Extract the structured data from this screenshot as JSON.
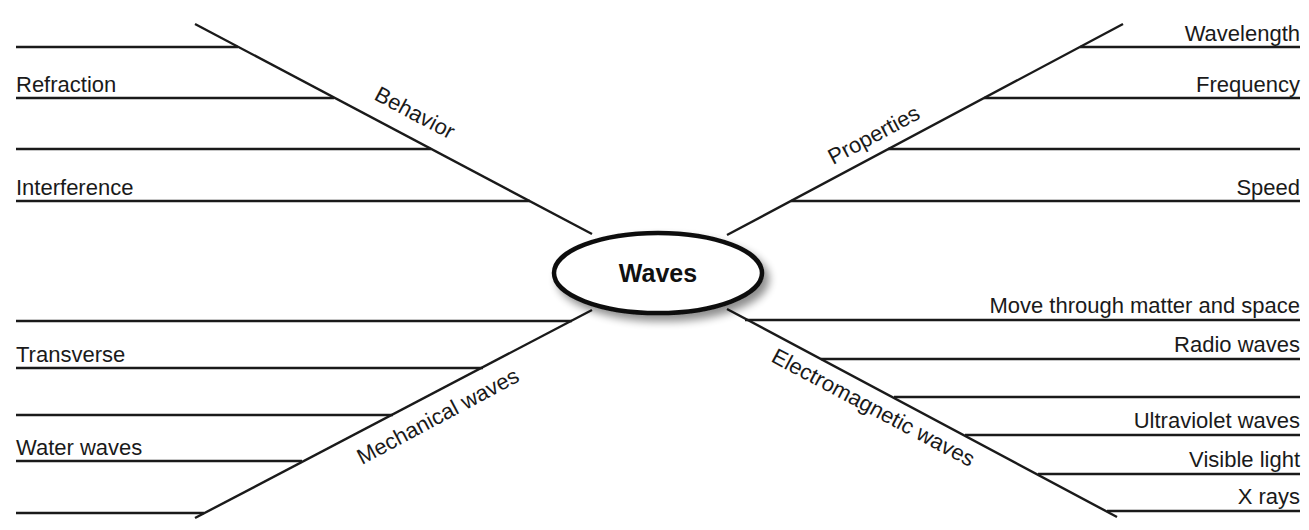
{
  "diagram": {
    "center": {
      "label": "Waves"
    },
    "branches": [
      {
        "id": "behavior",
        "label": "Behavior",
        "position": "top-left",
        "lines": [
          {
            "label": ""
          },
          {
            "label": "Refraction"
          },
          {
            "label": ""
          },
          {
            "label": "Interference"
          }
        ]
      },
      {
        "id": "properties",
        "label": "Properties",
        "position": "top-right",
        "lines": [
          {
            "label": "Wavelength"
          },
          {
            "label": "Frequency"
          },
          {
            "label": ""
          },
          {
            "label": "Speed"
          }
        ]
      },
      {
        "id": "mechanical",
        "label": "Mechanical waves",
        "position": "bottom-left",
        "lines": [
          {
            "label": ""
          },
          {
            "label": "Transverse"
          },
          {
            "label": ""
          },
          {
            "label": "Water waves"
          },
          {
            "label": ""
          }
        ]
      },
      {
        "id": "electromagnetic",
        "label": "Electromagnetic waves",
        "position": "bottom-right",
        "lines": [
          {
            "label": "Move through matter and space"
          },
          {
            "label": "Radio waves"
          },
          {
            "label": ""
          },
          {
            "label": "Ultraviolet waves"
          },
          {
            "label": "Visible light"
          },
          {
            "label": "X rays"
          }
        ]
      }
    ]
  },
  "colors": {
    "line": "#1a1a1a",
    "text": "#1a1a1a",
    "background": "#ffffff",
    "ellipse_fill": "#ffffff"
  }
}
